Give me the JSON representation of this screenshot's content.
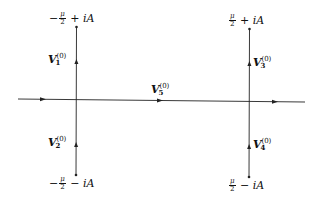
{
  "diagram": {
    "type": "contour-diagram",
    "stroke_color": "#222222",
    "background": "#ffffff",
    "horizontal_line": {
      "label_vector": "V",
      "label_index": "5",
      "label_superscript": "(0)",
      "direction": "right"
    },
    "vertical_lines": [
      {
        "position": "left",
        "top_endpoint": {
          "sign": "−",
          "frac_num": "μ",
          "frac_den": "2",
          "op": "+",
          "term": "iA"
        },
        "bottom_endpoint": {
          "sign": "−",
          "frac_num": "μ",
          "frac_den": "2",
          "op": "−",
          "term": "iA"
        },
        "upper_segment": {
          "label_vector": "V",
          "label_index": "1",
          "label_superscript": "(0)",
          "direction": "up"
        },
        "lower_segment": {
          "label_vector": "V",
          "label_index": "2",
          "label_superscript": "(0)",
          "direction": "up"
        }
      },
      {
        "position": "right",
        "top_endpoint": {
          "sign": "",
          "frac_num": "μ",
          "frac_den": "2",
          "op": "+",
          "term": "iA"
        },
        "bottom_endpoint": {
          "sign": "",
          "frac_num": "μ",
          "frac_den": "2",
          "op": "−",
          "term": "iA"
        },
        "upper_segment": {
          "label_vector": "V",
          "label_index": "3",
          "label_superscript": "(0)",
          "direction": "up"
        },
        "lower_segment": {
          "label_vector": "V",
          "label_index": "4",
          "label_superscript": "(0)",
          "direction": "up"
        }
      }
    ]
  }
}
